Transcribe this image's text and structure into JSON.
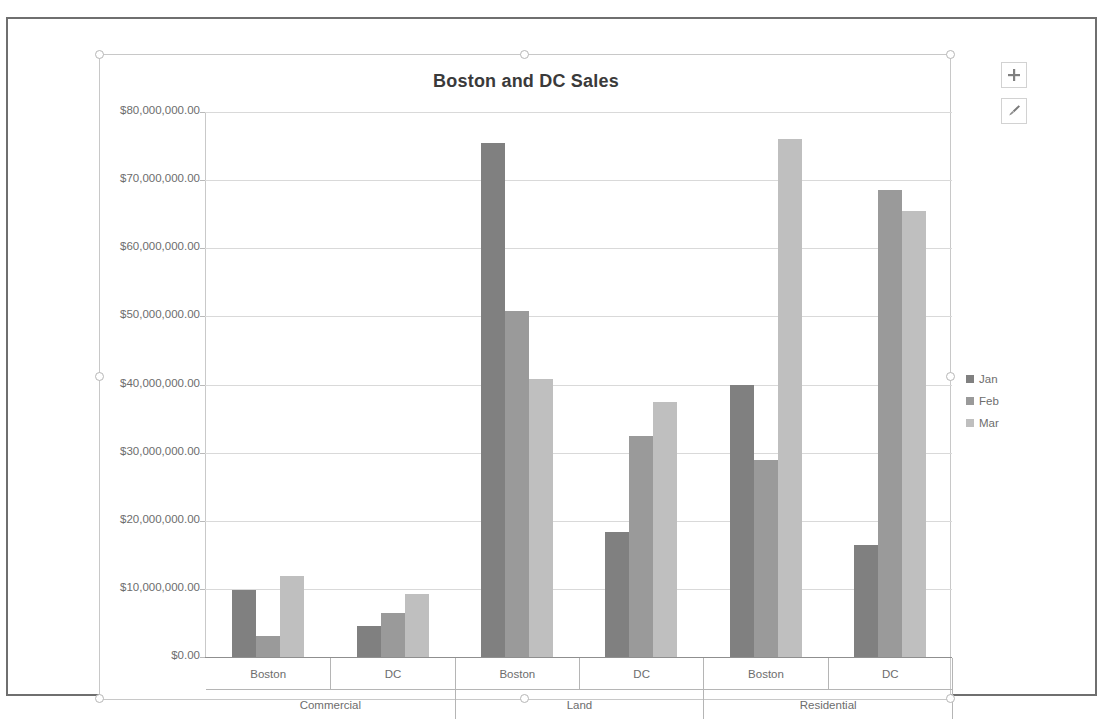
{
  "top_strip_text": "",
  "chart": {
    "title": "Boston and DC Sales",
    "buttons": {
      "elements": "Chart Elements",
      "styles": "Chart Styles"
    }
  },
  "legend": {
    "position": "right",
    "items": [
      {
        "label": "Jan",
        "color": "#808080"
      },
      {
        "label": "Feb",
        "color": "#9a9a9a"
      },
      {
        "label": "Mar",
        "color": "#bfbfbf"
      }
    ]
  },
  "axis": {
    "y_tick_labels": [
      "$80,000,000.00",
      "$70,000,000.00",
      "$60,000,000.00",
      "$50,000,000.00",
      "$40,000,000.00",
      "$30,000,000.00",
      "$20,000,000.00",
      "$10,000,000.00",
      "$0.00"
    ],
    "x_level1": [
      "Boston",
      "DC",
      "Boston",
      "DC",
      "Boston",
      "DC"
    ],
    "x_level2": [
      "Commercial",
      "Land",
      "Residential"
    ]
  },
  "chart_data": {
    "type": "bar",
    "title": "Boston and DC Sales",
    "xlabel": "",
    "ylabel": "",
    "ylim": [
      0,
      80000000
    ],
    "ytick_values": [
      0,
      10000000,
      20000000,
      30000000,
      40000000,
      50000000,
      60000000,
      70000000,
      80000000
    ],
    "grid": true,
    "legend_position": "right",
    "group_labels": [
      "Commercial",
      "Land",
      "Residential"
    ],
    "categories": [
      "Commercial - Boston",
      "Commercial - DC",
      "Land - Boston",
      "Land - DC",
      "Residential - Boston",
      "Residential - DC"
    ],
    "series": [
      {
        "name": "Jan",
        "color": "#808080",
        "values": [
          9900000,
          4600000,
          75400000,
          18300000,
          39900000,
          16400000
        ]
      },
      {
        "name": "Feb",
        "color": "#9a9a9a",
        "values": [
          3100000,
          6500000,
          50800000,
          32400000,
          28900000,
          68500000
        ]
      },
      {
        "name": "Mar",
        "color": "#bfbfbf",
        "values": [
          11900000,
          9300000,
          40800000,
          37500000,
          76000000,
          65400000
        ]
      }
    ]
  }
}
